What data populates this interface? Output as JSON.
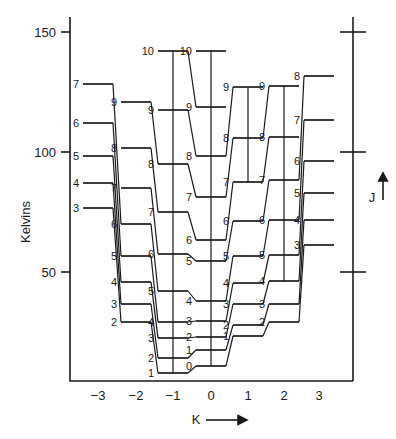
{
  "figure": {
    "y_axis_label": "Kelvins",
    "x_axis_label": "K",
    "x_axis_arrow": "→",
    "right_axis_label": "J",
    "right_axis_arrow": "↑"
  },
  "axes": {
    "y_ticks": [
      {
        "value": 150,
        "label": "150",
        "y": 32
      },
      {
        "value": 100,
        "label": "100",
        "y": 152
      },
      {
        "value": 50,
        "label": "50",
        "y": 272
      }
    ],
    "x_ticks": [
      {
        "value": -3,
        "label": "−3",
        "x": 98
      },
      {
        "value": -2,
        "label": "−2",
        "x": 136
      },
      {
        "value": -1,
        "label": "−1",
        "x": 173
      },
      {
        "value": 0,
        "label": "0",
        "x": 211
      },
      {
        "value": 1,
        "label": "1",
        "x": 248
      },
      {
        "value": 2,
        "label": "2",
        "x": 284
      },
      {
        "value": 3,
        "label": "3",
        "x": 319
      }
    ],
    "right_ticks": [
      {
        "value": 150,
        "y": 32
      },
      {
        "value": 100,
        "y": 152
      },
      {
        "value": 50,
        "y": 272
      }
    ],
    "plot_left": 70,
    "plot_right": 353,
    "plot_top": 17,
    "plot_bottom": 381,
    "kelvin_per_px": 0.4167,
    "zero_kelvin_y": 392
  },
  "chart_data": {
    "type": "scatter",
    "xlabel": "K",
    "ylabel": "Kelvins",
    "xlim": [
      -3.6,
      3.6
    ],
    "ylim": [
      0,
      160
    ],
    "grid": false,
    "legend": null,
    "note": "Energy level ladder; each column is a K value, each horizontal bar is a rotational level labelled by its J quantum number. Vertical lines join levels of the same K; diagonal lines join levels of adjacent K.",
    "columns": [
      {
        "K": -3,
        "x": 98,
        "levels": [
          {
            "J": 3,
            "label": "3",
            "kelvins": 60.0,
            "y": 208
          },
          {
            "J": 4,
            "label": "4",
            "kelvins": 70.4,
            "y": 183
          },
          {
            "J": 5,
            "label": "5",
            "kelvins": 81.7,
            "y": 156
          },
          {
            "J": 6,
            "label": "6",
            "kelvins": 95.4,
            "y": 123
          },
          {
            "J": 7,
            "label": "7",
            "kelvins": 111.7,
            "y": 84
          }
        ]
      },
      {
        "K": -2,
        "x": 136,
        "levels": [
          {
            "J": 2,
            "label": "2",
            "kelvins": 29.2,
            "y": 322
          },
          {
            "J": 3,
            "label": "3",
            "kelvins": 36.7,
            "y": 304
          },
          {
            "J": 4,
            "label": "4",
            "kelvins": 45.8,
            "y": 282
          },
          {
            "J": 5,
            "label": "5",
            "kelvins": 56.7,
            "y": 256
          },
          {
            "J": 6,
            "label": "6",
            "kelvins": 70.0,
            "y": 224
          },
          {
            "J": 7,
            "label": "7",
            "kelvins": 85.0,
            "y": 188
          },
          {
            "J": 8,
            "label": "8",
            "kelvins": 101.7,
            "y": 148
          },
          {
            "J": 9,
            "label": "9",
            "kelvins": 120.8,
            "y": 102
          }
        ]
      },
      {
        "K": -1,
        "x": 173,
        "levels": [
          {
            "J": 1,
            "label": "1",
            "kelvins": 3.8,
            "y": 373
          },
          {
            "J": 2,
            "label": "2",
            "kelvins": 10.0,
            "y": 358
          },
          {
            "J": 3,
            "label": "3",
            "kelvins": 18.3,
            "y": 338
          },
          {
            "J": 4,
            "label": "4",
            "kelvins": 29.2,
            "y": 322
          },
          {
            "J": 5,
            "label": "5",
            "kelvins": 42.1,
            "y": 291
          },
          {
            "J": 6,
            "label": "6",
            "kelvins": 57.5,
            "y": 254
          },
          {
            "J": 7,
            "label": "7",
            "kelvins": 75.0,
            "y": 212
          },
          {
            "J": 8,
            "label": "8",
            "kelvins": 95.0,
            "y": 164
          },
          {
            "J": 9,
            "label": "9",
            "kelvins": 117.5,
            "y": 110
          },
          {
            "J": 10,
            "label": "10",
            "kelvins": 142.1,
            "y": 51
          }
        ]
      },
      {
        "K": 0,
        "x": 211,
        "levels": [
          {
            "J": 0,
            "label": "0",
            "kelvins": 0.0,
            "y": 366
          },
          {
            "J": 1,
            "label": "1",
            "kelvins": 6.7,
            "y": 350
          },
          {
            "J": 2,
            "label": "2",
            "kelvins": 15.0,
            "y": 337
          },
          {
            "J": 3,
            "label": "3",
            "kelvins": 27.5,
            "y": 321
          },
          {
            "J": 4,
            "label": "4",
            "kelvins": 40.0,
            "y": 301
          },
          {
            "J": 5,
            "label": "5",
            "kelvins": 55.0,
            "y": 261
          },
          {
            "J": 6,
            "label": "6",
            "kelvins": 72.1,
            "y": 240
          },
          {
            "J": 7,
            "label": "7",
            "kelvins": 91.7,
            "y": 197
          },
          {
            "J": 8,
            "label": "8",
            "kelvins": 113.8,
            "y": 156
          },
          {
            "J": 9,
            "label": "9",
            "kelvins": 138.3,
            "y": 107
          },
          {
            "J": 10,
            "label": "10",
            "kelvins": 151.7,
            "y": 51
          }
        ]
      },
      {
        "K": 1,
        "x": 248,
        "levels": [
          {
            "J": 1,
            "label": "1",
            "kelvins": 12.1,
            "y": 336
          },
          {
            "J": 2,
            "label": "2",
            "kelvins": 19.2,
            "y": 325
          },
          {
            "J": 3,
            "label": "3",
            "kelvins": 28.3,
            "y": 304
          },
          {
            "J": 4,
            "label": "4",
            "kelvins": 41.7,
            "y": 283
          },
          {
            "J": 5,
            "label": "5",
            "kelvins": 55.8,
            "y": 256
          },
          {
            "J": 6,
            "label": "6",
            "kelvins": 72.5,
            "y": 221
          },
          {
            "J": 7,
            "label": "7",
            "kelvins": 92.5,
            "y": 182
          },
          {
            "J": 8,
            "label": "8",
            "kelvins": 113.3,
            "y": 138
          },
          {
            "J": 9,
            "label": "9",
            "kelvins": 137.5,
            "y": 87
          }
        ]
      },
      {
        "K": 2,
        "x": 284,
        "levels": [
          {
            "J": 2,
            "label": "2",
            "kelvins": 22.1,
            "y": 322
          },
          {
            "J": 3,
            "label": "3",
            "kelvins": 33.3,
            "y": 304
          },
          {
            "J": 4,
            "label": "4",
            "kelvins": 45.4,
            "y": 281
          },
          {
            "J": 5,
            "label": "5",
            "kelvins": 59.6,
            "y": 255
          },
          {
            "J": 6,
            "label": "6",
            "kelvins": 75.4,
            "y": 220
          },
          {
            "J": 7,
            "label": "7",
            "kelvins": 93.8,
            "y": 180
          },
          {
            "J": 8,
            "label": "8",
            "kelvins": 114.6,
            "y": 137
          },
          {
            "J": 9,
            "label": "9",
            "kelvins": 138.3,
            "y": 86
          }
        ]
      },
      {
        "K": 3,
        "x": 319,
        "levels": [
          {
            "J": 3,
            "label": "3",
            "kelvins": 61.3,
            "y": 245
          },
          {
            "J": 4,
            "label": "4",
            "kelvins": 72.1,
            "y": 220
          },
          {
            "J": 5,
            "label": "5",
            "kelvins": 84.6,
            "y": 193
          },
          {
            "J": 6,
            "label": "6",
            "kelvins": 98.8,
            "y": 161
          },
          {
            "J": 7,
            "label": "7",
            "kelvins": 115.8,
            "y": 120
          },
          {
            "J": 8,
            "label": "8",
            "kelvins": 135.4,
            "y": 76
          }
        ]
      }
    ],
    "vertical_transitions": [
      {
        "K": -1,
        "J_from": 1,
        "J_to": 10
      },
      {
        "K": 0,
        "J_from": 0,
        "J_to": 10
      },
      {
        "K": 1,
        "J_from": 7,
        "J_to": 9
      },
      {
        "K": 2,
        "J_from": 4,
        "J_to": 9
      }
    ],
    "diagonal_transitions": [
      {
        "from": {
          "K": -3,
          "J": 3
        },
        "to": {
          "K": -2,
          "J": 2
        }
      },
      {
        "from": {
          "K": -3,
          "J": 4
        },
        "to": {
          "K": -2,
          "J": 3
        }
      },
      {
        "from": {
          "K": -3,
          "J": 5
        },
        "to": {
          "K": -2,
          "J": 4
        }
      },
      {
        "from": {
          "K": -3,
          "J": 6
        },
        "to": {
          "K": -2,
          "J": 5
        }
      },
      {
        "from": {
          "K": -3,
          "J": 7
        },
        "to": {
          "K": -2,
          "J": 6
        }
      },
      {
        "from": {
          "K": -2,
          "J": 2
        },
        "to": {
          "K": -1,
          "J": 1
        }
      },
      {
        "from": {
          "K": -2,
          "J": 3
        },
        "to": {
          "K": -1,
          "J": 2
        }
      },
      {
        "from": {
          "K": -2,
          "J": 4
        },
        "to": {
          "K": -1,
          "J": 3
        }
      },
      {
        "from": {
          "K": -2,
          "J": 5
        },
        "to": {
          "K": -1,
          "J": 4
        }
      },
      {
        "from": {
          "K": -2,
          "J": 6
        },
        "to": {
          "K": -1,
          "J": 5
        }
      },
      {
        "from": {
          "K": -2,
          "J": 7
        },
        "to": {
          "K": -1,
          "J": 6
        }
      },
      {
        "from": {
          "K": -2,
          "J": 8
        },
        "to": {
          "K": -1,
          "J": 7
        }
      },
      {
        "from": {
          "K": -2,
          "J": 9
        },
        "to": {
          "K": -1,
          "J": 8
        }
      },
      {
        "from": {
          "K": -1,
          "J": 1
        },
        "to": {
          "K": 0,
          "J": 0
        }
      },
      {
        "from": {
          "K": -1,
          "J": 2
        },
        "to": {
          "K": 0,
          "J": 1
        }
      },
      {
        "from": {
          "K": -1,
          "J": 3
        },
        "to": {
          "K": 0,
          "J": 2
        }
      },
      {
        "from": {
          "K": -1,
          "J": 4
        },
        "to": {
          "K": 0,
          "J": 3
        }
      },
      {
        "from": {
          "K": -1,
          "J": 5
        },
        "to": {
          "K": 0,
          "J": 4
        }
      },
      {
        "from": {
          "K": -1,
          "J": 6
        },
        "to": {
          "K": 0,
          "J": 5
        }
      },
      {
        "from": {
          "K": -1,
          "J": 7
        },
        "to": {
          "K": 0,
          "J": 6
        }
      },
      {
        "from": {
          "K": -1,
          "J": 8
        },
        "to": {
          "K": 0,
          "J": 7
        }
      },
      {
        "from": {
          "K": -1,
          "J": 9
        },
        "to": {
          "K": 0,
          "J": 8
        }
      },
      {
        "from": {
          "K": -1,
          "J": 10
        },
        "to": {
          "K": 0,
          "J": 9
        }
      },
      {
        "from": {
          "K": 0,
          "J": 0
        },
        "to": {
          "K": 1,
          "J": 1
        }
      },
      {
        "from": {
          "K": 0,
          "J": 1
        },
        "to": {
          "K": 1,
          "J": 2
        }
      },
      {
        "from": {
          "K": 0,
          "J": 2
        },
        "to": {
          "K": 1,
          "J": 3
        }
      },
      {
        "from": {
          "K": 0,
          "J": 3
        },
        "to": {
          "K": 1,
          "J": 4
        }
      },
      {
        "from": {
          "K": 0,
          "J": 4
        },
        "to": {
          "K": 1,
          "J": 5
        }
      },
      {
        "from": {
          "K": 0,
          "J": 5
        },
        "to": {
          "K": 1,
          "J": 6
        }
      },
      {
        "from": {
          "K": 0,
          "J": 6
        },
        "to": {
          "K": 1,
          "J": 7
        }
      },
      {
        "from": {
          "K": 0,
          "J": 7
        },
        "to": {
          "K": 1,
          "J": 8
        }
      },
      {
        "from": {
          "K": 0,
          "J": 8
        },
        "to": {
          "K": 1,
          "J": 9
        }
      },
      {
        "from": {
          "K": 1,
          "J": 1
        },
        "to": {
          "K": 2,
          "J": 2
        }
      },
      {
        "from": {
          "K": 1,
          "J": 2
        },
        "to": {
          "K": 2,
          "J": 3
        }
      },
      {
        "from": {
          "K": 1,
          "J": 3
        },
        "to": {
          "K": 2,
          "J": 4
        }
      },
      {
        "from": {
          "K": 1,
          "J": 4
        },
        "to": {
          "K": 2,
          "J": 5
        }
      },
      {
        "from": {
          "K": 1,
          "J": 5
        },
        "to": {
          "K": 2,
          "J": 6
        }
      },
      {
        "from": {
          "K": 1,
          "J": 6
        },
        "to": {
          "K": 2,
          "J": 7
        }
      },
      {
        "from": {
          "K": 1,
          "J": 7
        },
        "to": {
          "K": 2,
          "J": 8
        }
      },
      {
        "from": {
          "K": 1,
          "J": 8
        },
        "to": {
          "K": 2,
          "J": 9
        }
      },
      {
        "from": {
          "K": 2,
          "J": 2
        },
        "to": {
          "K": 3,
          "J": 3
        }
      },
      {
        "from": {
          "K": 2,
          "J": 3
        },
        "to": {
          "K": 3,
          "J": 4
        }
      },
      {
        "from": {
          "K": 2,
          "J": 4
        },
        "to": {
          "K": 3,
          "J": 5
        }
      },
      {
        "from": {
          "K": 2,
          "J": 5
        },
        "to": {
          "K": 3,
          "J": 6
        }
      },
      {
        "from": {
          "K": 2,
          "J": 6
        },
        "to": {
          "K": 3,
          "J": 7
        }
      },
      {
        "from": {
          "K": 2,
          "J": 7
        },
        "to": {
          "K": 3,
          "J": 8
        }
      }
    ]
  },
  "style": {
    "ink": "#1a1a1a",
    "background": "#ffffff"
  }
}
